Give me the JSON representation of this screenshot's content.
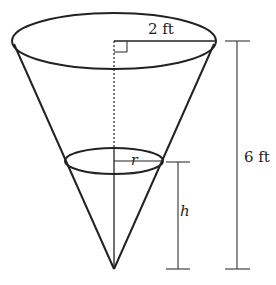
{
  "diagram": {
    "type": "inverted-cone",
    "labels": {
      "top_radius": "2 ft",
      "total_height": "6 ft",
      "water_radius": "r",
      "water_height": "h"
    },
    "colors": {
      "stroke": "#222222",
      "background": "#ffffff"
    }
  }
}
